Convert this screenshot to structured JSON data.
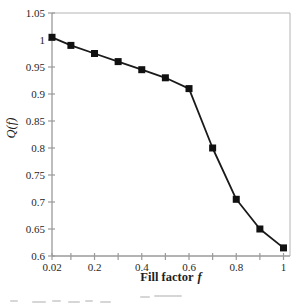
{
  "figure": {
    "background": "#ffffff",
    "caption_fragment_color": "#d6d6d6"
  },
  "chart_data": {
    "type": "line",
    "title": "",
    "xlabel": "Fill factor",
    "xlabel_var": "f",
    "ylabel": "Q(f)",
    "x": [
      0.02,
      0.1,
      0.2,
      0.3,
      0.4,
      0.5,
      0.6,
      0.7,
      0.8,
      0.9,
      1
    ],
    "y": [
      1.005,
      0.99,
      0.975,
      0.96,
      0.945,
      0.93,
      0.91,
      0.8,
      0.705,
      0.65,
      0.615
    ],
    "xlim": [
      0.02,
      1.03
    ],
    "ylim": [
      0.6,
      1.05
    ],
    "x_ticks": [
      0.02,
      0.1,
      0.2,
      0.3,
      0.4,
      0.5,
      0.6,
      0.7,
      0.8,
      0.9,
      1
    ],
    "x_tick_labels": [
      "0.02",
      "",
      "0.2",
      "",
      "0.4",
      "",
      "0.6",
      "",
      "0.8",
      "",
      "1"
    ],
    "y_ticks": [
      1.05,
      1,
      0.95,
      0.9,
      0.85,
      0.8,
      0.75,
      0.7,
      0.65,
      0.6
    ],
    "y_tick_labels": [
      "1.05",
      "1",
      "0.95",
      "0.9",
      "0.85",
      "0.8",
      "0.75",
      "0.7",
      "0.65",
      "0.6"
    ],
    "grid": false,
    "legend": "none",
    "marker": "filled-square",
    "colors": {
      "line": "#1a1a1a",
      "marker": "#111111",
      "axis": "#9a9a9a",
      "frame": "#b4b4b4",
      "text": "#1f1f1f"
    }
  }
}
